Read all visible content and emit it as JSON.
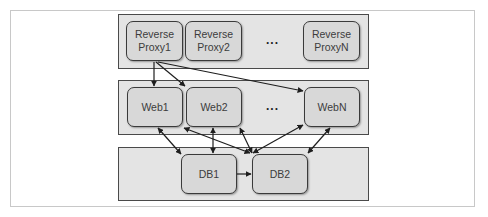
{
  "diagram": {
    "tiers": [
      {
        "name": "reverse-proxy-tier",
        "nodes": [
          {
            "id": "rp1",
            "lines": [
              "Reverse",
              "Proxy1"
            ]
          },
          {
            "id": "rp2",
            "lines": [
              "Reverse",
              "Proxy2"
            ]
          },
          {
            "id": "rpN",
            "lines": [
              "Reverse",
              "ProxyN"
            ]
          }
        ],
        "ellipsis": "..."
      },
      {
        "name": "web-tier",
        "nodes": [
          {
            "id": "web1",
            "lines": [
              "Web1"
            ]
          },
          {
            "id": "web2",
            "lines": [
              "Web2"
            ]
          },
          {
            "id": "webN",
            "lines": [
              "WebN"
            ]
          }
        ],
        "ellipsis": "..."
      },
      {
        "name": "database-tier",
        "nodes": [
          {
            "id": "db1",
            "lines": [
              "DB1"
            ]
          },
          {
            "id": "db2",
            "lines": [
              "DB2"
            ]
          }
        ]
      }
    ],
    "edges": [
      {
        "from": "rp1",
        "to": "web1",
        "type": "one-way"
      },
      {
        "from": "rp1",
        "to": "web2",
        "type": "one-way"
      },
      {
        "from": "rp1",
        "to": "webN",
        "type": "one-way"
      },
      {
        "from": "web1",
        "to": "db1",
        "type": "two-way"
      },
      {
        "from": "web2",
        "to": "db1",
        "type": "two-way"
      },
      {
        "from": "web1",
        "to": "db2",
        "type": "two-way"
      },
      {
        "from": "web2",
        "to": "db2",
        "type": "two-way"
      },
      {
        "from": "webN",
        "to": "db2",
        "type": "two-way"
      },
      {
        "from": "webN",
        "to": "db2",
        "type": "two-way"
      },
      {
        "from": "db1",
        "to": "db2",
        "type": "one-way",
        "label": "replication"
      }
    ],
    "colors": {
      "panel_fill": "#e4e4e4",
      "node_fill": "#d8d8d8",
      "border": "#3a3a3a",
      "arrow": "#1e1e1e"
    }
  }
}
